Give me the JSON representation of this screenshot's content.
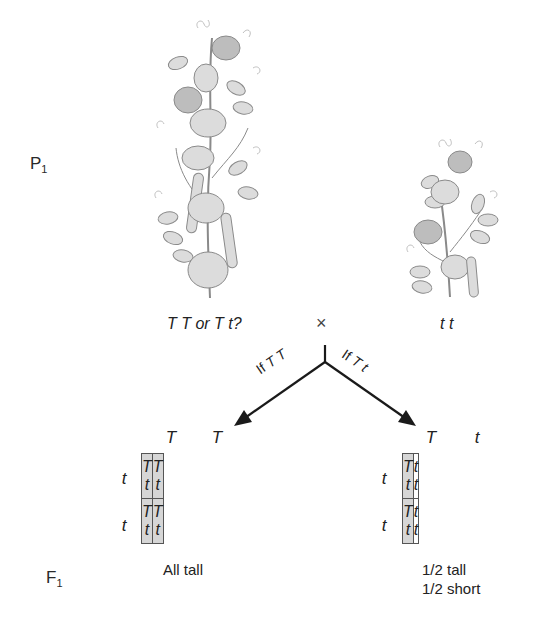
{
  "generations": {
    "parental": {
      "letter": "P",
      "subscript": "1"
    },
    "filial": {
      "letter": "F",
      "subscript": "1"
    }
  },
  "plants": [
    {
      "id": "tall-plant",
      "description": "tall pea plant illustration",
      "genotype_text": "T T or T t?"
    },
    {
      "id": "short-plant",
      "description": "short pea plant illustration",
      "genotype_text": "t t"
    }
  ],
  "cross_symbol": "×",
  "branches": [
    {
      "label_prefix": "If",
      "label_genotype": "T T",
      "direction": "left"
    },
    {
      "label_prefix": "If",
      "label_genotype": "T t",
      "direction": "right"
    }
  ],
  "punnett_squares": [
    {
      "name": "if-TT",
      "column_alleles": [
        "T",
        "T"
      ],
      "row_alleles": [
        "t",
        "t"
      ],
      "cells": [
        [
          "T t",
          "T t"
        ],
        [
          "T t",
          "T t"
        ]
      ],
      "shaded": [
        [
          true,
          true
        ],
        [
          true,
          true
        ]
      ],
      "outcome": [
        "All tall"
      ]
    },
    {
      "name": "if-Tt",
      "column_alleles": [
        "T",
        "t"
      ],
      "row_alleles": [
        "t",
        "t"
      ],
      "cells": [
        [
          "T t",
          "t t"
        ],
        [
          "T t",
          "t t"
        ]
      ],
      "shaded": [
        [
          true,
          false
        ],
        [
          true,
          false
        ]
      ],
      "outcome": [
        "1/2 tall",
        "1/2 short"
      ]
    }
  ],
  "colors": {
    "tall_cell": "#d6d6d6",
    "short_cell": "#ffffff",
    "grid_line": "#555555",
    "arrow": "#1a1a1a",
    "plant_gray": "#8a8a8a"
  }
}
